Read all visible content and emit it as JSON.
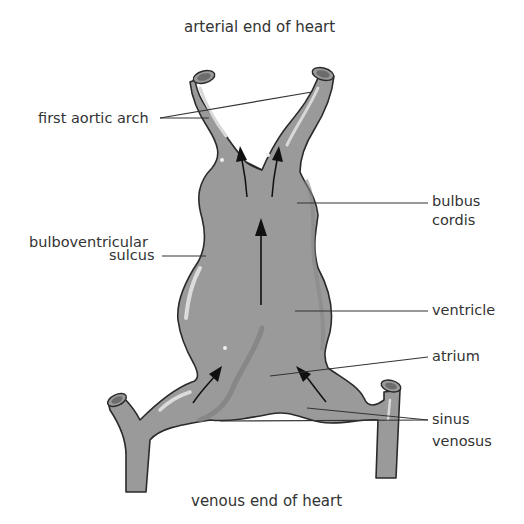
{
  "diagram": {
    "title_top": "arterial end of heart",
    "title_bottom": "venous end of heart",
    "labels": {
      "first_aortic_arch": "first aortic arch",
      "bulboventricular_line1": "bulboventricular",
      "bulboventricular_line2": "sulcus",
      "bulbus_line1": "bulbus",
      "bulbus_line2": "cordis",
      "ventricle": "ventricle",
      "atrium": "atrium",
      "sinus_line1": "sinus",
      "sinus_line2": "venosus"
    },
    "colors": {
      "tissue_fill": "#9a9a9a",
      "outline": "#2a2a2a",
      "highlight": "#d8d8d8",
      "shadow": "#858585",
      "leader_line": "#333333",
      "arrow": "#111111",
      "text": "#333333"
    }
  }
}
